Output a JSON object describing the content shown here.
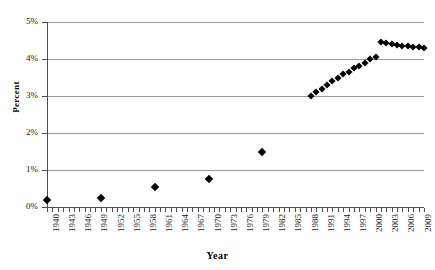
{
  "chart_data": {
    "type": "scatter",
    "title": "",
    "xlabel": "Year",
    "ylabel": "Percent",
    "xlim": [
      1940,
      2010
    ],
    "ylim": [
      0,
      5
    ],
    "grid": true,
    "legend": "none",
    "marker": "filled-diamond",
    "marker_color": "#000000",
    "y_tick_labels": [
      "0%",
      "1%",
      "2%",
      "3%",
      "4%",
      "5%"
    ],
    "y_tick_values": [
      0,
      1,
      2,
      3,
      4,
      5
    ],
    "x_tick_labels": [
      "1940",
      "1943",
      "1946",
      "1949",
      "1952",
      "1955",
      "1958",
      "1961",
      "1964",
      "1967",
      "1970",
      "1973",
      "1976",
      "1979",
      "1982",
      "1985",
      "1988",
      "1991",
      "1994",
      "1997",
      "2000",
      "2003",
      "2006",
      "2009"
    ],
    "x_tick_values": [
      1940,
      1943,
      1946,
      1949,
      1952,
      1955,
      1958,
      1961,
      1964,
      1967,
      1970,
      1973,
      1976,
      1979,
      1982,
      1985,
      1988,
      1991,
      1994,
      1997,
      2000,
      2003,
      2006,
      2009
    ],
    "series": [
      {
        "name": "Percent",
        "x": [
          1940,
          1950,
          1960,
          1970,
          1980,
          1989,
          1990,
          1991,
          1992,
          1993,
          1994,
          1995,
          1996,
          1997,
          1998,
          1999,
          2000,
          2001,
          2002,
          2003,
          2004,
          2005,
          2006,
          2007,
          2008,
          2009,
          2010
        ],
        "values": [
          0.2,
          0.25,
          0.55,
          0.75,
          1.5,
          3.0,
          3.1,
          3.2,
          3.3,
          3.4,
          3.5,
          3.6,
          3.65,
          3.75,
          3.8,
          3.9,
          4.0,
          4.05,
          4.45,
          4.42,
          4.4,
          4.38,
          4.36,
          4.34,
          4.33,
          4.32,
          4.3
        ]
      }
    ]
  }
}
